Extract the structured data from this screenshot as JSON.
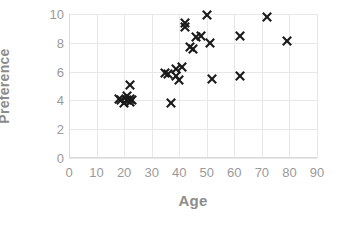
{
  "chart_data": {
    "type": "scatter",
    "title": "",
    "xlabel": "Age",
    "ylabel": "Preference",
    "xlim": [
      0,
      90
    ],
    "ylim": [
      0,
      10
    ],
    "xticks": [
      0,
      10,
      20,
      30,
      40,
      50,
      60,
      70,
      80,
      90
    ],
    "yticks": [
      0,
      2,
      4,
      6,
      8,
      10
    ],
    "grid": true,
    "legend": null,
    "marker_style": "x",
    "marker_color": "#1a1a1a",
    "series": [
      {
        "name": "observations",
        "points": [
          [
            18,
            4.1
          ],
          [
            19,
            4.0
          ],
          [
            20,
            3.8
          ],
          [
            21,
            4.0
          ],
          [
            21,
            4.3
          ],
          [
            22,
            3.9
          ],
          [
            22,
            4.1
          ],
          [
            22,
            5.1
          ],
          [
            23,
            4.0
          ],
          [
            35,
            5.9
          ],
          [
            36,
            5.8
          ],
          [
            37,
            3.8
          ],
          [
            39,
            5.7
          ],
          [
            39,
            6.2
          ],
          [
            40,
            5.4
          ],
          [
            41,
            6.3
          ],
          [
            42,
            9.4
          ],
          [
            42,
            9.1
          ],
          [
            44,
            7.7
          ],
          [
            45,
            7.6
          ],
          [
            46,
            8.4
          ],
          [
            48,
            8.5
          ],
          [
            50,
            9.9
          ],
          [
            51,
            8.0
          ],
          [
            52,
            5.5
          ],
          [
            62,
            8.5
          ],
          [
            62,
            5.7
          ],
          [
            72,
            9.8
          ],
          [
            79,
            8.1
          ]
        ]
      }
    ]
  },
  "axes": {
    "x_tick_labels": [
      "0",
      "10",
      "20",
      "30",
      "40",
      "50",
      "60",
      "70",
      "80",
      "90"
    ],
    "y_tick_labels": [
      "0",
      "2",
      "4",
      "6",
      "8",
      "10"
    ],
    "x_title": "Age",
    "y_title": "Preference"
  },
  "colors": {
    "marker": "#1a1a1a",
    "grid": "#e8e8e8",
    "axis": "#d9d9d9",
    "tick_text": "#9a9a9a",
    "axis_title": "#8c8c8c",
    "background": "#ffffff"
  }
}
